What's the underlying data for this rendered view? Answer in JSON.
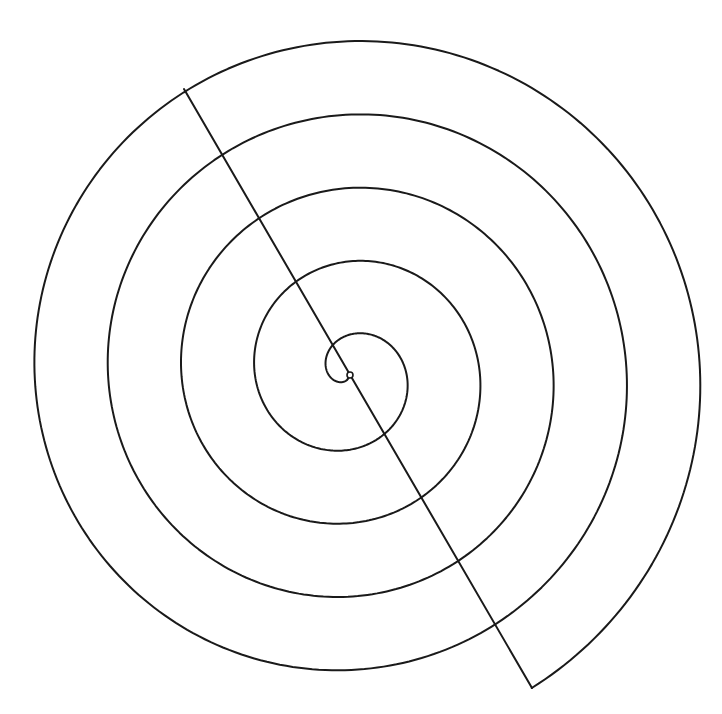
{
  "diagram": {
    "type": "archimedean-spiral",
    "canvas": {
      "width": 722,
      "height": 714,
      "background": "#ffffff"
    },
    "stroke_color": "#1a1a1a",
    "center": {
      "x": 349,
      "y": 374
    },
    "center_marker": {
      "shape": "small-circle",
      "radius": 3
    },
    "spiral": {
      "direction": "clockwise-outward",
      "reference_angle_deg": 239.8,
      "radius_at_reference": 33,
      "radius_growth_per_half_turn": 36.7,
      "start_angle_deg": 95,
      "end_angle_deg": 1859.8,
      "turns_after_reference": 4.5,
      "outer_end_point": {
        "x": 532,
        "y": 688
      }
    },
    "diagonal_line": {
      "from": {
        "x": 184,
        "y": 89
      },
      "to": {
        "x": 532,
        "y": 688
      },
      "passes_through_center": true,
      "crossings_upper_left": [
        {
          "x": 334,
          "y": 345
        },
        {
          "x": 294,
          "y": 276
        },
        {
          "x": 258,
          "y": 213
        },
        {
          "x": 222,
          "y": 151
        },
        {
          "x": 184,
          "y": 89
        }
      ],
      "crossings_lower_right": [
        {
          "x": 390,
          "y": 441
        },
        {
          "x": 426,
          "y": 505
        },
        {
          "x": 461,
          "y": 568
        },
        {
          "x": 497,
          "y": 630
        },
        {
          "x": 532,
          "y": 688
        }
      ]
    },
    "extents": {
      "left_x": 33,
      "right_x": 701,
      "top_y": 36,
      "bottom_y": 673
    }
  }
}
